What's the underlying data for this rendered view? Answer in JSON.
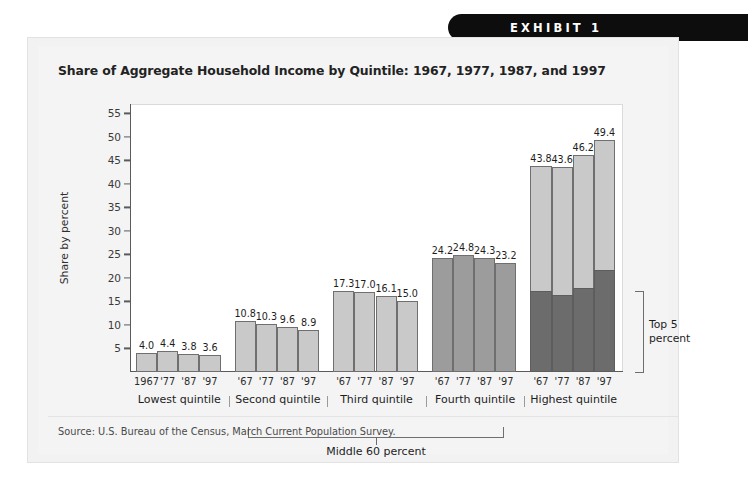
{
  "banner": {
    "label": "EXHIBIT 1"
  },
  "card": {
    "title": "Share of Aggregate Household Income by Quintile: 1967, 1977, 1987, and 1997",
    "source": "Source: U.S. Bureau of the Census, March Current Population Survey."
  },
  "annotations": {
    "middle_bracket_label": "Middle 60 percent",
    "top5_label_line1": "Top 5",
    "top5_label_line2": "percent"
  },
  "colors": {
    "bar_light": "#c9c9c9",
    "bar_medium": "#9c9c9c",
    "bar_dark": "#6c6c6c",
    "axis": "#5b5b5b",
    "banner_bg": "#0d0d0d",
    "card_bg": "#f2f2f2",
    "plot_bg": "#ffffff"
  },
  "chart_data": {
    "type": "bar",
    "title": "Share of Aggregate Household Income by Quintile: 1967, 1977, 1987, and 1997",
    "xlabel": "",
    "ylabel": "Share by percent",
    "ylim": [
      0,
      57
    ],
    "yticks": [
      5,
      10,
      15,
      20,
      25,
      30,
      35,
      40,
      45,
      50,
      55
    ],
    "grid": false,
    "legend": "none",
    "x": [
      "1967",
      "'77",
      "'87",
      "'97"
    ],
    "groups": [
      {
        "name": "Lowest quintile",
        "tick_labels": [
          "1967",
          "'77",
          "'87",
          "'97"
        ],
        "values": [
          4.0,
          4.4,
          3.8,
          3.6
        ],
        "value_labels": [
          "4.0",
          "4.4",
          "3.8",
          "3.6"
        ],
        "fill": "#c9c9c9"
      },
      {
        "name": "Second quintile",
        "tick_labels": [
          "'67",
          "'77",
          "'87",
          "'97"
        ],
        "values": [
          10.8,
          10.3,
          9.6,
          8.9
        ],
        "value_labels": [
          "10.8",
          "10.3",
          "9.6",
          "8.9"
        ],
        "fill": "#c9c9c9"
      },
      {
        "name": "Third quintile",
        "tick_labels": [
          "'67",
          "'77",
          "'87",
          "'97"
        ],
        "values": [
          17.3,
          17.0,
          16.1,
          15.0
        ],
        "value_labels": [
          "17.3",
          "17.0",
          "16.1",
          "15.0"
        ],
        "fill": "#c9c9c9"
      },
      {
        "name": "Fourth quintile",
        "tick_labels": [
          "'67",
          "'77",
          "'87",
          "'97"
        ],
        "values": [
          24.2,
          24.8,
          24.3,
          23.2
        ],
        "value_labels": [
          "24.2",
          "24.8",
          "24.3",
          "23.2"
        ],
        "fill": "#9c9c9c"
      },
      {
        "name": "Highest quintile",
        "tick_labels": [
          "'67",
          "'77",
          "'87",
          "'97"
        ],
        "values": [
          43.8,
          43.6,
          46.2,
          49.4
        ],
        "value_labels": [
          "43.8",
          "43.6",
          "46.2",
          "49.4"
        ],
        "fill": "#c9c9c9",
        "sub_series": {
          "name": "Top 5 percent",
          "values": [
            17.2,
            16.4,
            17.9,
            21.7
          ],
          "fill": "#6c6c6c"
        }
      }
    ],
    "annotations": [
      {
        "text": "Middle 60 percent",
        "spans": [
          "Second quintile",
          "Third quintile",
          "Fourth quintile"
        ]
      },
      {
        "text": "Top 5 percent",
        "spans": [
          "Highest quintile"
        ]
      }
    ]
  }
}
